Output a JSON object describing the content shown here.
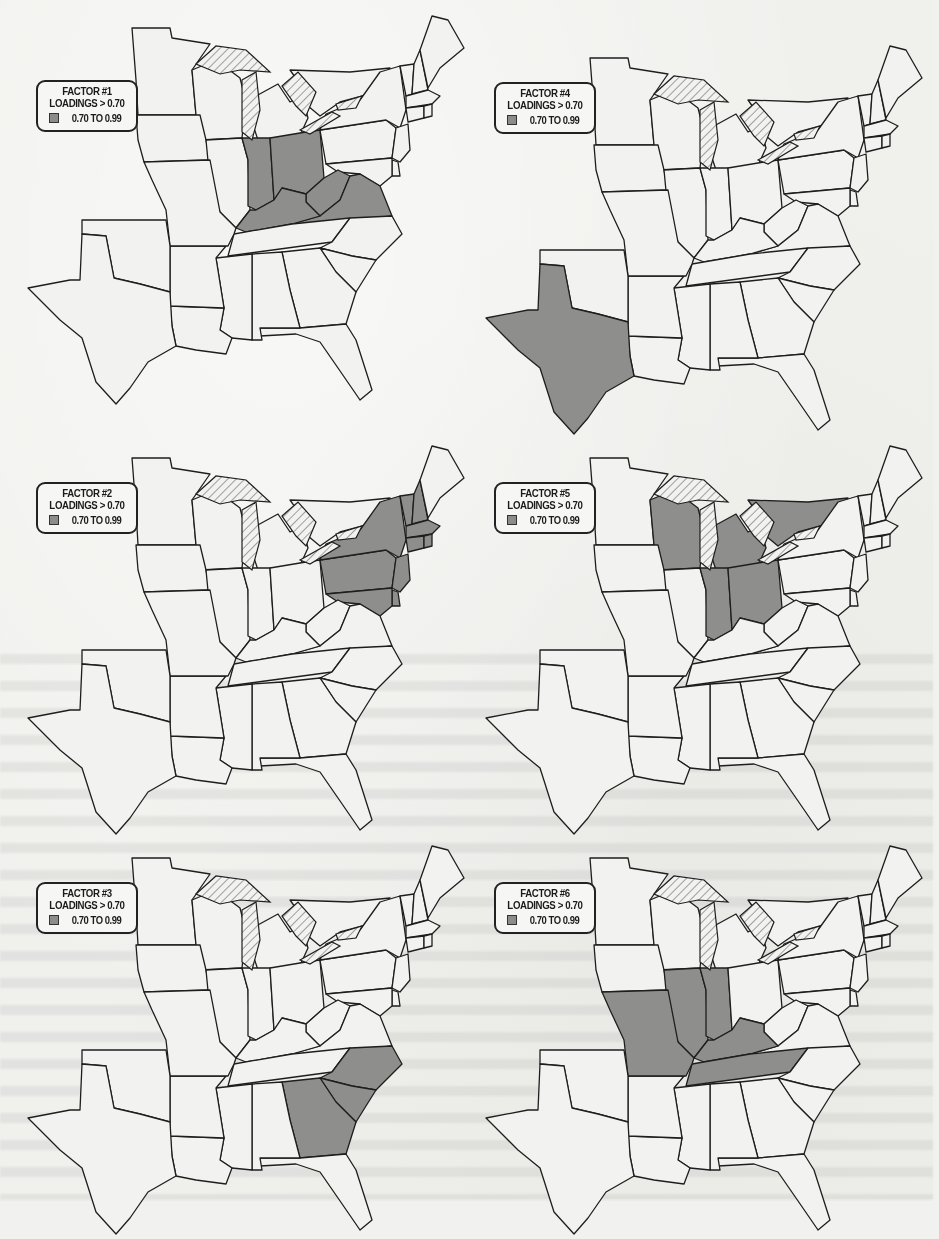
{
  "figure": {
    "colors": {
      "shaded": "#8e8e8c",
      "shaded_dark": "#7a7a78",
      "outline": "#1e1e1e",
      "land": "#f2f2f0",
      "lake_hatch": "#555555"
    },
    "panels": [
      {
        "id": "factor-1",
        "legend": {
          "title": "FACTOR #1",
          "subtitle": "LOADINGS > 0.70",
          "range_label": "0.70 TO 0.99"
        },
        "shaded_states": [
          "Indiana",
          "Ohio",
          "Kentucky",
          "West Virginia",
          "Virginia"
        ]
      },
      {
        "id": "factor-4",
        "legend": {
          "title": "FACTOR #4",
          "subtitle": "LOADINGS > 0.70",
          "range_label": "0.70 TO 0.99"
        },
        "shaded_states": [
          "Texas"
        ]
      },
      {
        "id": "factor-2",
        "legend": {
          "title": "FACTOR #2",
          "subtitle": "LOADINGS > 0.70",
          "range_label": "0.70 TO 0.99"
        },
        "shaded_states": [
          "New York",
          "Pennsylvania",
          "Vermont",
          "New Hampshire",
          "Massachusetts",
          "Connecticut",
          "Rhode Island",
          "New Jersey",
          "Delaware",
          "Maryland"
        ]
      },
      {
        "id": "factor-5",
        "legend": {
          "title": "FACTOR #5",
          "subtitle": "LOADINGS > 0.70",
          "range_label": "0.70 TO 0.99"
        },
        "shaded_states": [
          "Wisconsin",
          "Michigan",
          "Indiana",
          "Ohio",
          "Ontario"
        ]
      },
      {
        "id": "factor-3",
        "legend": {
          "title": "FACTOR #3",
          "subtitle": "LOADINGS > 0.70",
          "range_label": "0.70 TO 0.99"
        },
        "shaded_states": [
          "North Carolina",
          "South Carolina",
          "Georgia"
        ]
      },
      {
        "id": "factor-6",
        "legend": {
          "title": "FACTOR #6",
          "subtitle": "LOADINGS > 0.70",
          "range_label": "0.70 TO 0.99"
        },
        "shaded_states": [
          "Missouri",
          "Illinois",
          "Indiana",
          "Kentucky",
          "Tennessee"
        ]
      }
    ]
  }
}
